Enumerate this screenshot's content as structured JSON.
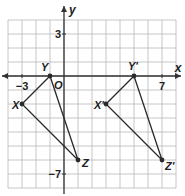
{
  "diagram": {
    "type": "coordinate-grid-translation",
    "grid": {
      "x_min": -4,
      "x_max": 8,
      "y_min": -8,
      "y_max": 4,
      "cell_px": 14,
      "origin_px": [
        64,
        76
      ],
      "grid_color": "#b8b8b8",
      "axis_color": "#333333"
    },
    "axes": {
      "x_label": "x",
      "y_label": "y",
      "origin_label": "O",
      "tick_labels": [
        {
          "axis": "x",
          "value": -3,
          "text": "−3"
        },
        {
          "axis": "x",
          "value": 7,
          "text": "7"
        },
        {
          "axis": "y",
          "value": 3,
          "text": "3"
        },
        {
          "axis": "y",
          "value": -7,
          "text": "−7"
        }
      ]
    },
    "triangles": [
      {
        "name": "XYZ",
        "vertices": [
          {
            "label": "X",
            "x": -3,
            "y": -2
          },
          {
            "label": "Y",
            "x": -1,
            "y": 0
          },
          {
            "label": "Z",
            "x": 1,
            "y": -6
          }
        ]
      },
      {
        "name": "X'Y'Z'",
        "vertices": [
          {
            "label": "X'",
            "x": 3,
            "y": -2
          },
          {
            "label": "Y'",
            "x": 5,
            "y": 0
          },
          {
            "label": "Z'",
            "x": 7,
            "y": -6
          }
        ]
      }
    ],
    "line_color": "#2a2a2a"
  }
}
